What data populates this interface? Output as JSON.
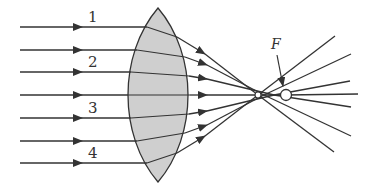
{
  "diagram": {
    "ray_labels": [
      "1",
      "2",
      "3",
      "4"
    ],
    "focus_label": "F",
    "colors": {
      "line": "#333333",
      "lens_fill": "#cfcfcf",
      "background": "#ffffff"
    },
    "incoming_ray_y": [
      27,
      50,
      72,
      95,
      118,
      141,
      163
    ]
  }
}
